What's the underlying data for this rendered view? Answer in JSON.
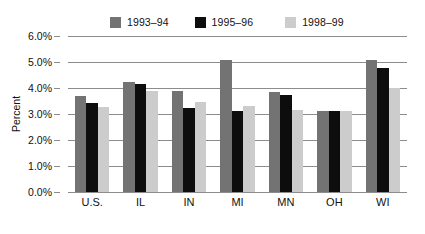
{
  "chart_data": {
    "type": "bar",
    "title": "",
    "subtitle": "",
    "xlabel": "",
    "ylabel": "Percent",
    "categories": [
      "U.S.",
      "IL",
      "IN",
      "MI",
      "MN",
      "OH",
      "WI"
    ],
    "series": [
      {
        "name": "1993–94",
        "color": "#737373",
        "values": [
          3.68,
          4.22,
          3.88,
          5.08,
          3.85,
          3.1,
          5.08
        ]
      },
      {
        "name": "1995–96",
        "color": "#0d0d0d",
        "values": [
          3.42,
          4.17,
          3.22,
          3.12,
          3.72,
          3.12,
          4.78
        ]
      },
      {
        "name": "1998–99",
        "color": "#cccccc",
        "values": [
          3.28,
          3.9,
          3.47,
          3.32,
          3.15,
          3.12,
          4.0
        ]
      }
    ],
    "ylim": [
      0.0,
      6.0
    ],
    "ytick_values": [
      6.0,
      5.0,
      4.0,
      3.0,
      2.0,
      1.0,
      0.0
    ],
    "ytick_labels": [
      "6.0%",
      "5.0%",
      "4.0%",
      "3.0%",
      "2.0%",
      "1.0%",
      "0.0%"
    ],
    "grid": true,
    "grid_axis": "y",
    "legend_position": "top-center",
    "legend_entries": [
      "1993–94",
      "1995–96",
      "1998–99"
    ],
    "background_color": "#ffffff",
    "gridline_color": "#8c8c8c",
    "text_color": "#111111"
  }
}
